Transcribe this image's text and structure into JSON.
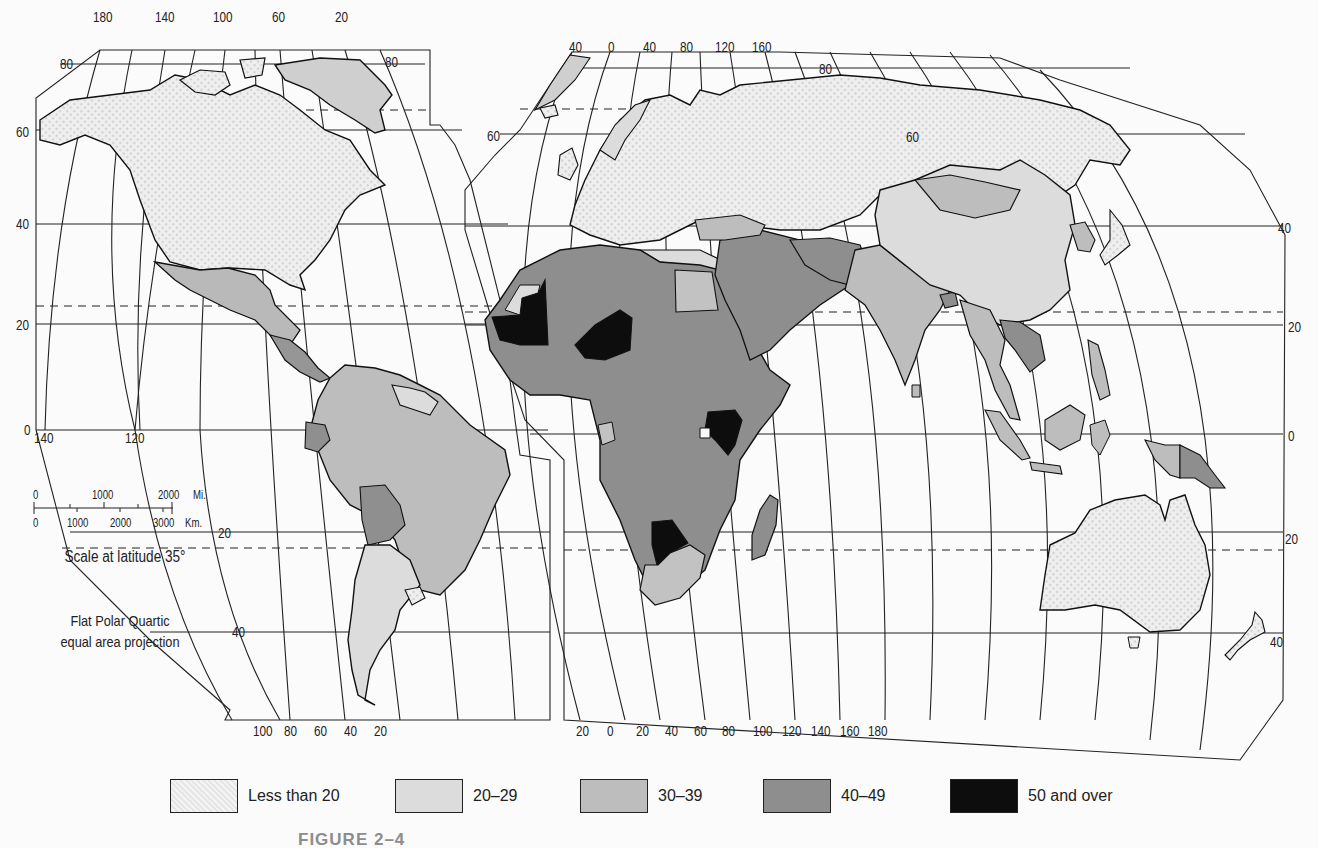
{
  "figure": {
    "caption": "FIGURE 2–4",
    "projection_note_line1": "Flat Polar Quartic",
    "projection_note_line2": "equal area projection"
  },
  "scale_bar": {
    "title": "Scale at latitude 35°",
    "miles_labels": [
      "0",
      "1000",
      "2000",
      "Mi."
    ],
    "km_labels": [
      "0",
      "1000",
      "2000",
      "3000",
      "Km."
    ]
  },
  "legend": {
    "items": [
      {
        "label": "Less than 20",
        "color": "#ebebeb",
        "pattern": "dotted"
      },
      {
        "label": "20–29",
        "color": "#dcdcdc",
        "pattern": "solid"
      },
      {
        "label": "30–39",
        "color": "#bdbdbd",
        "pattern": "solid"
      },
      {
        "label": "40–49",
        "color": "#8e8e8e",
        "pattern": "solid"
      },
      {
        "label": "50 and over",
        "color": "#0d0d0d",
        "pattern": "solid"
      }
    ]
  },
  "west_panel": {
    "top_longitudes": [
      "180",
      "140",
      "100",
      "60",
      "20"
    ],
    "bottom_longitudes": [
      "100",
      "80",
      "60",
      "40",
      "20"
    ],
    "left_latitudes": [
      "80",
      "60",
      "40",
      "20",
      "0"
    ],
    "right_latitude_top": "80",
    "equator_longitudes": [
      "140",
      "120"
    ],
    "south_latitudes": [
      "20",
      "40"
    ]
  },
  "east_panel": {
    "top_longitudes": [
      "40",
      "0",
      "40",
      "80",
      "120",
      "160"
    ],
    "bottom_longitudes": [
      "20",
      "0",
      "20",
      "40",
      "60",
      "80",
      "100",
      "120",
      "140",
      "160",
      "180"
    ],
    "left_latitude": "60",
    "right_latitudes": [
      "80",
      "60",
      "40",
      "20",
      "0",
      "20",
      "40"
    ]
  },
  "regions": {
    "north_america": "Less than 20",
    "greenland": "30–39",
    "mexico_central_america": "30–39",
    "south_america_north": "30–39",
    "argentina": "20–29",
    "bolivia_ecuador": "40–49",
    "europe_russia": "Less than 20",
    "north_africa": "20–29",
    "sub_saharan_africa": "40–49",
    "mauritania_niger_kenya_botswana": "50 and over",
    "south_africa": "30–39",
    "middle_east": "40–49",
    "south_asia": "30–39",
    "china": "20–29",
    "mongolia": "30–39",
    "southeast_asia": "30–39",
    "indochina": "40–49",
    "australia": "Less than 20",
    "papua_new_guinea": "40–49",
    "new_zealand": "Less than 20"
  }
}
